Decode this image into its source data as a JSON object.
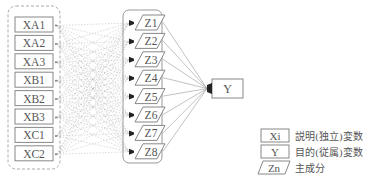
{
  "diagram": {
    "inputs": [
      "XA1",
      "XA2",
      "XA3",
      "XB1",
      "XB2",
      "XB3",
      "XC1",
      "XC2"
    ],
    "components": [
      "Z1",
      "Z2",
      "Z3",
      "Z4",
      "Z5",
      "Z6",
      "Z7",
      "Z8"
    ],
    "output": "Y"
  },
  "legend": [
    {
      "symbol": "Xi",
      "shape": "rectangle",
      "label": "説明(独立)変数"
    },
    {
      "symbol": "Y",
      "shape": "rectangle",
      "label": "目的(従属)変数"
    },
    {
      "symbol": "Zn",
      "shape": "parallelogram",
      "label": "主成分"
    }
  ],
  "colors": {
    "stroke": "#888888",
    "text": "#555555",
    "dash": "#aaaaaa",
    "arrow": "#222222"
  }
}
